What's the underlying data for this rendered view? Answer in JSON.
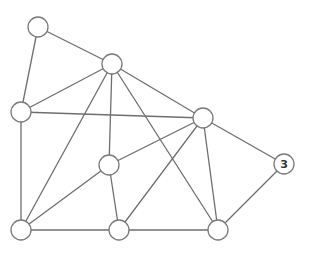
{
  "diagram": {
    "type": "undirected-graph",
    "node_radius": 10,
    "nodes": [
      {
        "id": "A",
        "x": 38,
        "y": 27,
        "label": ""
      },
      {
        "id": "B",
        "x": 112,
        "y": 64,
        "label": ""
      },
      {
        "id": "C",
        "x": 21,
        "y": 112,
        "label": ""
      },
      {
        "id": "D",
        "x": 203,
        "y": 118,
        "label": ""
      },
      {
        "id": "E",
        "x": 109,
        "y": 165,
        "label": ""
      },
      {
        "id": "F",
        "x": 284,
        "y": 164,
        "label": "3"
      },
      {
        "id": "G",
        "x": 21,
        "y": 230,
        "label": ""
      },
      {
        "id": "H",
        "x": 119,
        "y": 230,
        "label": ""
      },
      {
        "id": "I",
        "x": 218,
        "y": 230,
        "label": ""
      }
    ],
    "edges": [
      [
        "A",
        "B"
      ],
      [
        "A",
        "C"
      ],
      [
        "B",
        "C"
      ],
      [
        "B",
        "G"
      ],
      [
        "B",
        "E"
      ],
      [
        "B",
        "I"
      ],
      [
        "B",
        "D"
      ],
      [
        "C",
        "D"
      ],
      [
        "C",
        "G"
      ],
      [
        "D",
        "E"
      ],
      [
        "D",
        "H"
      ],
      [
        "D",
        "I"
      ],
      [
        "D",
        "F"
      ],
      [
        "E",
        "G"
      ],
      [
        "E",
        "H"
      ],
      [
        "G",
        "H"
      ],
      [
        "H",
        "I"
      ],
      [
        "I",
        "F"
      ]
    ]
  }
}
